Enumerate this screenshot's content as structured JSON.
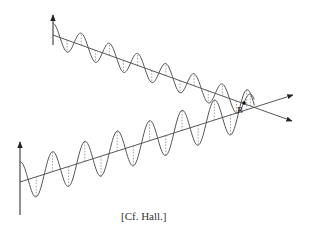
{
  "figure": {
    "caption": "[Cf. Hall.]",
    "intersection_label": "B",
    "colors": {
      "line": "#444444",
      "wave": "#555555",
      "dash": "#777777",
      "background": "#ffffff"
    }
  },
  "waves": [
    {
      "name": "upper-wave",
      "origin": [
        53,
        35
      ],
      "end": [
        292,
        121
      ],
      "amplitude": 12,
      "wavelength": 30,
      "phase": 0
    },
    {
      "name": "lower-wave",
      "origin": [
        20,
        182
      ],
      "end": [
        293,
        95
      ],
      "amplitude": 20,
      "wavelength": 34,
      "phase": 0
    }
  ]
}
